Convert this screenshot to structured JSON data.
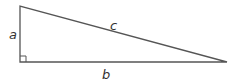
{
  "diagram": {
    "type": "right-triangle",
    "stroke_color": "#555555",
    "labels": {
      "a": "a",
      "b": "b",
      "c": "c"
    },
    "vertices": {
      "top": [
        20,
        6
      ],
      "right_angle": [
        20,
        62
      ],
      "far": [
        227,
        62
      ]
    },
    "right_angle_marker": true
  }
}
